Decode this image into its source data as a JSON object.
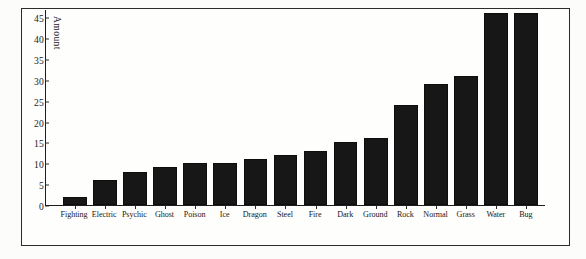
{
  "figure": {
    "background_color": "#fcfcfb",
    "frame_color": "#2b2b2b",
    "bar_color": "#171717"
  },
  "axis": {
    "y_title": "Amount",
    "y_ticks": [
      "0",
      "5",
      "10",
      "15",
      "20",
      "25",
      "30",
      "35",
      "40",
      "45"
    ]
  },
  "chart_data": {
    "type": "bar",
    "title": "",
    "xlabel": "",
    "ylabel": "Amount",
    "ylim": [
      0,
      47
    ],
    "grid": false,
    "legend": "none",
    "orientation": "vertical",
    "sorted": "ascending",
    "categories": [
      "Fighting",
      "Electric",
      "Psychic",
      "Ghost",
      "Poison",
      "Ice",
      "Dragon",
      "Steel",
      "Fire",
      "Dark",
      "Ground",
      "Rock",
      "Normal",
      "Grass",
      "Water",
      "Bug"
    ],
    "values": [
      2,
      6,
      8,
      9,
      10,
      10,
      11,
      12,
      13,
      15,
      16,
      24,
      29,
      31,
      46,
      46
    ],
    "ytick_values": [
      0,
      5,
      10,
      15,
      20,
      25,
      30,
      35,
      40,
      45
    ],
    "ytick_labels": [
      "0",
      "5",
      "10",
      "15",
      "20",
      "25",
      "30",
      "35",
      "40",
      "45"
    ]
  }
}
